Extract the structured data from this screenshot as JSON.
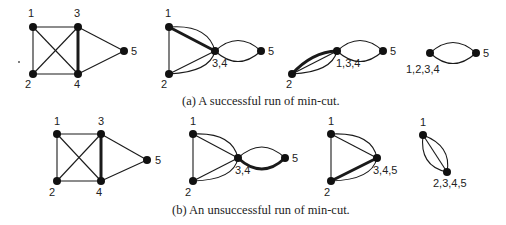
{
  "captions": {
    "a": "(a) A successful run of min-cut.",
    "b": "(b) An unsuccessful run of min-cut."
  },
  "colors": {
    "ink": "#111111",
    "background": "#ffffff"
  },
  "rows": [
    {
      "id": "a",
      "panels": [
        {
          "nodes": [
            {
              "id": "1",
              "label": "1",
              "x": 33,
              "y": 27
            },
            {
              "id": "3",
              "label": "3",
              "x": 78,
              "y": 27
            },
            {
              "id": "5",
              "label": "5",
              "x": 124,
              "y": 51
            },
            {
              "id": "2",
              "label": "2",
              "x": 33,
              "y": 74
            },
            {
              "id": "4",
              "label": "4",
              "x": 78,
              "y": 74
            }
          ],
          "edges": [
            [
              "1",
              "3"
            ],
            [
              "1",
              "2"
            ],
            [
              "1",
              "4"
            ],
            [
              "2",
              "3"
            ],
            [
              "2",
              "4"
            ],
            [
              "3",
              "4",
              "thick"
            ],
            [
              "3",
              "5"
            ],
            [
              "4",
              "5"
            ]
          ]
        },
        {
          "nodes": [
            {
              "id": "1",
              "label": "1",
              "x": 169,
              "y": 27
            },
            {
              "id": "34",
              "label": "3,4",
              "x": 215,
              "y": 51
            },
            {
              "id": "5",
              "label": "5",
              "x": 261,
              "y": 51
            },
            {
              "id": "2",
              "label": "2",
              "x": 169,
              "y": 74
            }
          ]
        },
        {
          "nodes": [
            {
              "id": "134",
              "label": "1,3,4",
              "x": 337,
              "y": 51
            },
            {
              "id": "5",
              "label": "5",
              "x": 383,
              "y": 51
            },
            {
              "id": "2",
              "label": "2",
              "x": 292,
              "y": 74
            }
          ]
        },
        {
          "nodes": [
            {
              "id": "1234",
              "label": "1,2,3,4",
              "x": 430,
              "y": 53
            },
            {
              "id": "5",
              "label": "5",
              "x": 476,
              "y": 53
            }
          ]
        }
      ]
    },
    {
      "id": "b",
      "panels": [
        {
          "nodes": [
            {
              "id": "1",
              "label": "1",
              "x": 57,
              "y": 134
            },
            {
              "id": "3",
              "label": "3",
              "x": 101,
              "y": 134
            },
            {
              "id": "5",
              "label": "5",
              "x": 147,
              "y": 160
            },
            {
              "id": "2",
              "label": "2",
              "x": 57,
              "y": 181
            },
            {
              "id": "4",
              "label": "4",
              "x": 101,
              "y": 181
            }
          ]
        },
        {
          "nodes": [
            {
              "id": "1",
              "label": "1",
              "x": 193,
              "y": 134
            },
            {
              "id": "34",
              "label": "3,4",
              "x": 238,
              "y": 158
            },
            {
              "id": "5",
              "label": "5",
              "x": 285,
              "y": 158
            },
            {
              "id": "2",
              "label": "2",
              "x": 193,
              "y": 181
            }
          ]
        },
        {
          "nodes": [
            {
              "id": "1",
              "label": "1",
              "x": 331,
              "y": 134
            },
            {
              "id": "345",
              "label": "3,4,5",
              "x": 377,
              "y": 158
            },
            {
              "id": "2",
              "label": "2",
              "x": 331,
              "y": 181
            }
          ]
        },
        {
          "nodes": [
            {
              "id": "1",
              "label": "1",
              "x": 423,
              "y": 135
            },
            {
              "id": "2345",
              "label": "2,3,4,5",
              "x": 447,
              "y": 172
            }
          ]
        }
      ]
    }
  ]
}
